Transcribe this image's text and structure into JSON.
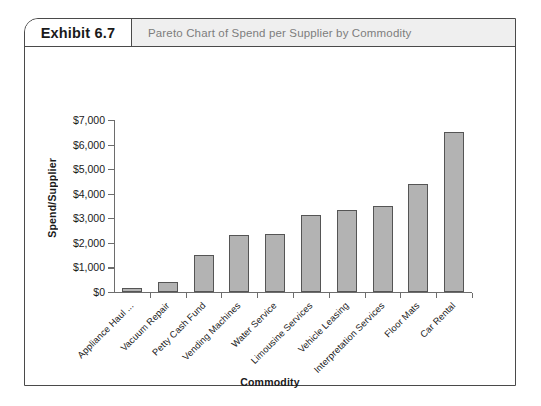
{
  "exhibit": {
    "number": "Exhibit 6.7",
    "caption": "Pareto Chart of Spend per Supplier by Commodity"
  },
  "chart_data": {
    "type": "bar",
    "title": "Pareto Chart of Spend per Supplier by Commodity",
    "xlabel": "Commodity",
    "ylabel": "Spend/Supplier",
    "ylim": [
      0,
      7000
    ],
    "ytick_labels": [
      "$7,000",
      "$6,000",
      "$5,000",
      "$4,000",
      "$3,000",
      "$2,000",
      "$1,000",
      "$0"
    ],
    "ytick_values": [
      7000,
      6000,
      5000,
      4000,
      3000,
      2000,
      1000,
      0
    ],
    "grid": false,
    "legend": "none",
    "bar_color": "#b3b3b3",
    "bar_edge_color": "#555555",
    "categories": [
      "Appliance Haul ...",
      "Vacuum Repair",
      "Petty Cash Fund",
      "Vending Machines",
      "Water Service",
      "Limousine Services",
      "Vehicle Leasing",
      "Interpretation Services",
      "Floor Mats",
      "Car Rental"
    ],
    "values": [
      150,
      400,
      1500,
      2300,
      2350,
      3150,
      3350,
      3500,
      4400,
      6500
    ]
  }
}
